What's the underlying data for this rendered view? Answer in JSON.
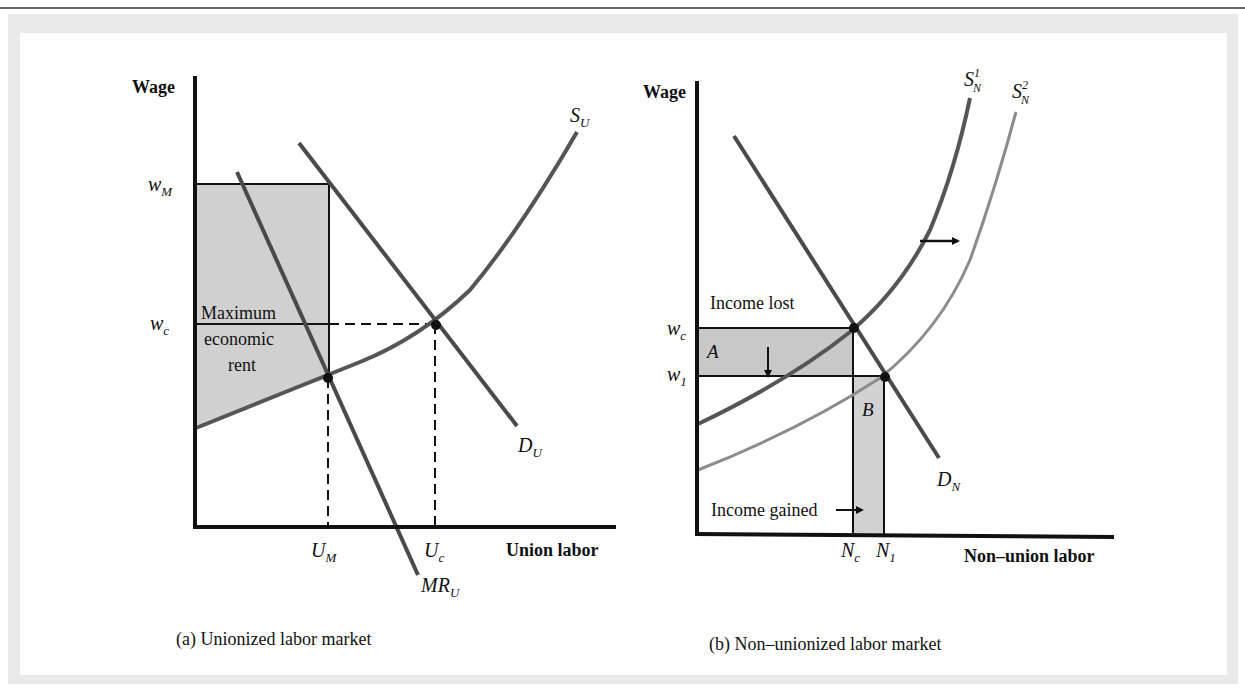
{
  "figure": {
    "panels": [
      {
        "id": "a",
        "caption": "(a) Unionized labor market",
        "y_axis_label": "Wage",
        "x_axis_label": "Union labor",
        "y_ticks": [
          {
            "base": "w",
            "sub": "M"
          },
          {
            "base": "w",
            "sub": "c"
          }
        ],
        "x_ticks": [
          {
            "base": "U",
            "sub": "M"
          },
          {
            "base": "U",
            "sub": "c"
          }
        ],
        "curves": [
          {
            "base": "S",
            "sub": "U",
            "type": "supply"
          },
          {
            "base": "D",
            "sub": "U",
            "type": "demand"
          },
          {
            "base": "MR",
            "sub": "U",
            "type": "marginal-revenue"
          }
        ],
        "shaded_region_label": [
          "Maximum",
          "economic",
          "rent"
        ]
      },
      {
        "id": "b",
        "caption": "(b) Non–unionized labor market",
        "y_axis_label": "Wage",
        "x_axis_label": "Non–union labor",
        "y_ticks": [
          {
            "base": "w",
            "sub": "c"
          },
          {
            "base": "w",
            "sub": "1"
          }
        ],
        "x_ticks": [
          {
            "base": "N",
            "sub": "c"
          },
          {
            "base": "N",
            "sub": "1"
          }
        ],
        "curves": [
          {
            "base": "S",
            "sub": "N",
            "sup": "1",
            "type": "supply"
          },
          {
            "base": "S",
            "sub": "N",
            "sup": "2",
            "type": "supply-shifted"
          },
          {
            "base": "D",
            "sub": "N",
            "type": "demand"
          }
        ],
        "annotations": {
          "income_lost": "Income lost",
          "income_gained": "Income gained",
          "area_a": "A",
          "area_b": "B"
        }
      }
    ],
    "colors": {
      "axis": "#111111",
      "curve_dark": "#4a4a4a",
      "curve_light": "#8c8c8c",
      "shade": "#cfcfcf",
      "frame": "#e9e9e9"
    }
  }
}
